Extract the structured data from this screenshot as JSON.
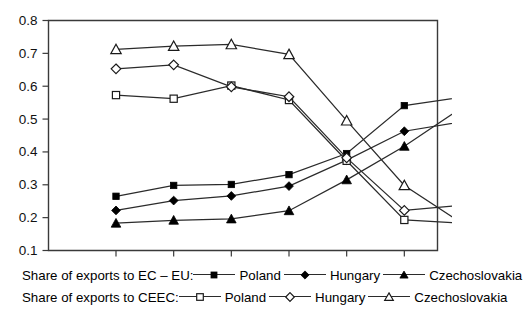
{
  "chart_data": {
    "type": "line",
    "title": "",
    "xlabel": "",
    "ylabel": "",
    "x": [
      1986,
      1987,
      1988,
      1989,
      1990,
      1991,
      1992
    ],
    "categories": [
      "1986",
      "1987",
      "1988",
      "1989",
      "1990",
      "1991",
      "1992"
    ],
    "ylim": [
      0.1,
      0.8
    ],
    "yticks": [
      0.1,
      0.2,
      0.3,
      0.4,
      0.5,
      0.6,
      0.7,
      0.8
    ],
    "ytick_labels": [
      "0.1",
      "0.2",
      "0.3",
      "0.4",
      "0.5",
      "0.6",
      "0.7",
      "0.8"
    ],
    "grid": false,
    "legend_position": "below-plot",
    "series": [
      {
        "name": "Poland",
        "group": "Share of exports to EC – EU:",
        "marker": "filled-square",
        "values": [
          0.265,
          0.298,
          0.301,
          0.331,
          0.395,
          0.541,
          0.567
        ]
      },
      {
        "name": "Hungary",
        "group": "Share of exports to EC – EU:",
        "marker": "filled-diamond",
        "values": [
          0.222,
          0.252,
          0.266,
          0.296,
          0.375,
          0.463,
          0.492
        ]
      },
      {
        "name": "Czechoslovakia",
        "group": "Share of exports to EC – EU:",
        "marker": "filled-triangle",
        "values": [
          0.183,
          0.192,
          0.196,
          0.221,
          0.315,
          0.417,
          0.535
        ]
      },
      {
        "name": "Poland",
        "group": "Share of exports to CEEC:",
        "marker": "open-square",
        "values": [
          0.573,
          0.562,
          0.602,
          0.558,
          0.373,
          0.193,
          0.183
        ]
      },
      {
        "name": "Hungary",
        "group": "Share of exports to CEEC:",
        "marker": "open-diamond",
        "values": [
          0.653,
          0.665,
          0.598,
          0.568,
          0.382,
          0.222,
          0.238
        ]
      },
      {
        "name": "Czechoslovakia",
        "group": "Share of exports to CEEC:",
        "marker": "open-triangle",
        "values": [
          0.712,
          0.722,
          0.727,
          0.697,
          0.495,
          0.298,
          0.183
        ]
      }
    ]
  },
  "legend": {
    "rows": [
      {
        "title": "Share of exports to EC – EU:",
        "entries": [
          {
            "label": "Poland",
            "marker": "filled-square"
          },
          {
            "label": "Hungary",
            "marker": "filled-diamond"
          },
          {
            "label": "Czechoslovakia",
            "marker": "filled-triangle"
          }
        ]
      },
      {
        "title": "Share of exports to CEEC:",
        "entries": [
          {
            "label": "Poland",
            "marker": "open-square"
          },
          {
            "label": "Hungary",
            "marker": "open-diamond"
          },
          {
            "label": "Czechoslovakia",
            "marker": "open-triangle"
          }
        ]
      }
    ]
  },
  "colors": {
    "ink": "#000000",
    "axis": "#3a3a3a",
    "line": "#2b2b2b",
    "background": "#ffffff"
  }
}
